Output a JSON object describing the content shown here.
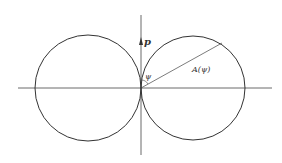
{
  "diagram": {
    "type": "polar-radiation-pattern",
    "labels": {
      "axis_vector": "p",
      "angle": "ψ",
      "radius": "A(ψ)"
    },
    "colors": {
      "stroke": "#333333",
      "background": "#ffffff"
    }
  }
}
